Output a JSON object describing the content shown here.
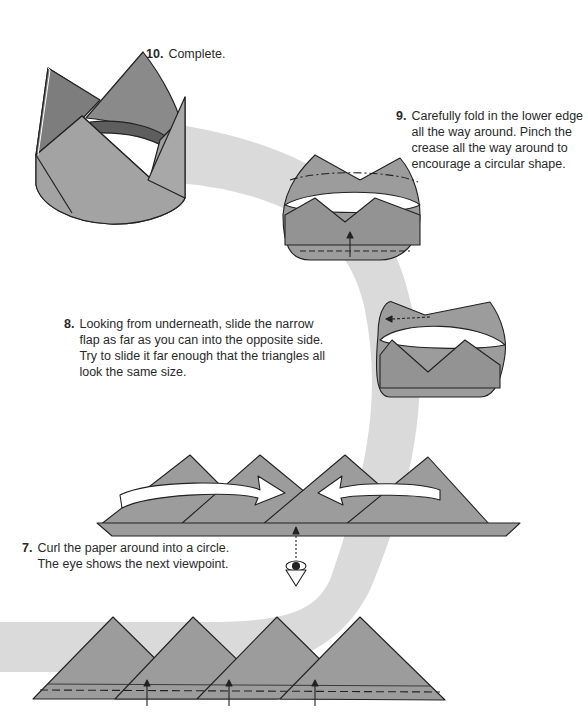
{
  "colors": {
    "paper": "#9c9c9c",
    "paper_dark": "#7a7a7a",
    "path_arc": "#dadada",
    "line": "#222222",
    "text": "#2a2a2a"
  },
  "steps": [
    {
      "number": "10.",
      "text": "Complete."
    },
    {
      "number": "9.",
      "lines": [
        "Carefully fold in the lower edge",
        "all the way around. Pinch the",
        "crease all the way around to",
        "encourage a circular shape."
      ]
    },
    {
      "number": "8.",
      "lines": [
        "Looking from underneath, slide the narrow",
        "flap as far as you can into the opposite side.",
        "Try to slide it far enough that the triangles all",
        "look the same size."
      ]
    },
    {
      "number": "7.",
      "lines": [
        "Curl the paper around into a circle.",
        "The eye shows the next viewpoint."
      ]
    }
  ],
  "icons": {
    "eye": "eye-viewpoint-icon",
    "curl_arrow": "curl-arrow-icon",
    "fold_arrow": "fold-up-arrow-icon",
    "slide_arrow": "slide-arrow-icon"
  }
}
